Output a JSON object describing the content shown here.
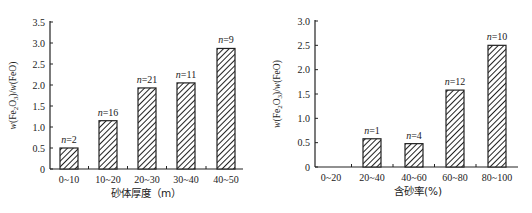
{
  "chart_data": [
    {
      "type": "bar",
      "title": "",
      "categories": [
        "0~10",
        "10~20",
        "20~30",
        "30~40",
        "40~50"
      ],
      "values": [
        0.5,
        1.15,
        1.93,
        2.05,
        2.87
      ],
      "annotations": [
        "n=2",
        "n=16",
        "n=21",
        "n=11",
        "n=9"
      ],
      "xlabel": "砂体厚度（m）",
      "ylabel": "w(Fe2O3)/w(FeO)",
      "ylim": [
        0,
        3.5
      ],
      "yticks": [
        "0",
        "0.5",
        "1.0",
        "1.5",
        "2.0",
        "2.5",
        "3.0",
        "3.5"
      ],
      "grid": false,
      "legend": null,
      "bar_fill": "diagonal-hatch"
    },
    {
      "type": "bar",
      "title": "",
      "categories": [
        "0~20",
        "20~40",
        "40~60",
        "60~80",
        "80~100"
      ],
      "values": [
        0,
        0.58,
        0.48,
        1.58,
        2.5
      ],
      "annotations": [
        "",
        "n=1",
        "n=4",
        "n=12",
        "n=10"
      ],
      "xlabel": "含砂率(%)",
      "ylabel": "w(Fe2O3)/w(FeO)",
      "ylim": [
        0,
        3.0
      ],
      "yticks": [
        "0",
        "0.5",
        "1.0",
        "1.5",
        "2.0",
        "2.5",
        "3.0"
      ],
      "grid": false,
      "legend": null,
      "bar_fill": "diagonal-hatch"
    }
  ],
  "colors": {
    "axis": "#222222",
    "bar_stroke": "#222222",
    "hatch": "#222222",
    "background": "#ffffff"
  }
}
